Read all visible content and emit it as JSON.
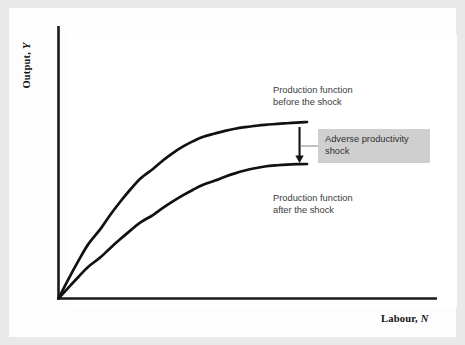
{
  "figure": {
    "background_color": "#e9e9e9",
    "page_color": "#fdfdfd",
    "plot_color": "#ffffff"
  },
  "axes": {
    "y_label_prefix": "Output, ",
    "y_label_var": "Y",
    "x_label_prefix": "Labour, ",
    "x_label_var": "N",
    "axis_color": "#1a1a1a"
  },
  "annotations": {
    "before_label": "Production function\nbefore the shock",
    "after_label": "Production function\nafter the shock",
    "shock_label": "Adverse productivity\nshock",
    "shock_box_color": "#cfcfcf",
    "text_color": "#3b3b3b"
  },
  "chart_data": {
    "type": "line",
    "title": "",
    "xlabel": "Labour, N",
    "ylabel": "Output, Y",
    "xlim": [
      0,
      1
    ],
    "ylim": [
      0,
      1
    ],
    "grid": false,
    "legend": "annotations on curves",
    "axis_ticks": {
      "x": [],
      "y": []
    },
    "series": [
      {
        "name": "Production function before the shock",
        "color": "#111111",
        "x": [
          0.0,
          0.04,
          0.08,
          0.12,
          0.17,
          0.21,
          0.25,
          0.29,
          0.33,
          0.38,
          0.42,
          0.46,
          0.5,
          0.54,
          0.58,
          0.63,
          0.67,
          0.71,
          0.75,
          0.79,
          0.83,
          0.88,
          0.92,
          0.96,
          1.0
        ],
        "y": [
          0.0,
          0.11,
          0.213,
          0.308,
          0.396,
          0.477,
          0.551,
          0.619,
          0.68,
          0.734,
          0.782,
          0.824,
          0.86,
          0.89,
          0.915,
          0.935,
          0.95,
          0.962,
          0.971,
          0.978,
          0.984,
          0.989,
          0.993,
          0.997,
          1.0
        ]
      },
      {
        "name": "Production function after the shock",
        "color": "#111111",
        "x": [
          0.0,
          0.04,
          0.08,
          0.12,
          0.17,
          0.21,
          0.25,
          0.29,
          0.33,
          0.38,
          0.42,
          0.46,
          0.5,
          0.54,
          0.58,
          0.63,
          0.67,
          0.71,
          0.75,
          0.79,
          0.83,
          0.88,
          0.92,
          0.96,
          1.0
        ],
        "y": [
          0.0,
          0.062,
          0.122,
          0.18,
          0.235,
          0.288,
          0.338,
          0.386,
          0.431,
          0.473,
          0.513,
          0.55,
          0.584,
          0.615,
          0.643,
          0.668,
          0.69,
          0.709,
          0.725,
          0.738,
          0.748,
          0.755,
          0.759,
          0.761,
          0.762
        ]
      }
    ],
    "arrow": {
      "name": "adverse productivity shock arrow",
      "x": 0.97,
      "y_start": 1.0,
      "y_end": 0.762,
      "direction": "down"
    }
  }
}
